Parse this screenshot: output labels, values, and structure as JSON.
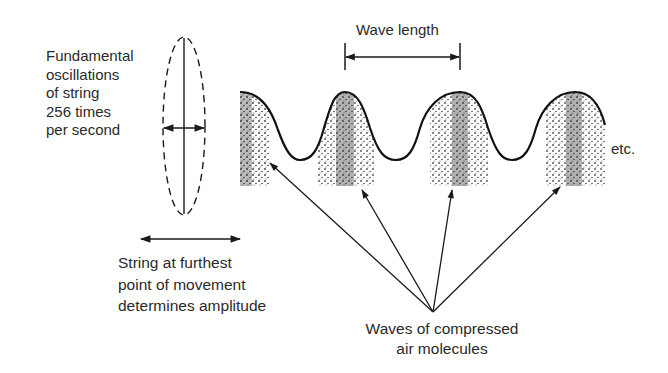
{
  "diagram": {
    "title": "",
    "labels": {
      "fundamental_line1": "Fundamental",
      "fundamental_line2": "oscillations",
      "fundamental_line3": "of string",
      "fundamental_line4": "256 times",
      "fundamental_line5": "per second",
      "amplitude_line1": "String at furthest",
      "amplitude_line2": "point of movement",
      "amplitude_line3": "determines amplitude",
      "wavelength": "Wave length",
      "etc": "etc.",
      "waves_line1": "Waves of compressed",
      "waves_line2": "air molecules"
    },
    "elements": {
      "string": "vertical vibrating string within dashed ellipse",
      "oscillation_arrow": "double-headed horizontal arrow",
      "amplitude_arrow": "double-headed horizontal arrow",
      "wave": "sinusoidal wave with stippled compression bands",
      "wavelength_marker": "double-headed arrow between crests",
      "pointer_arrows": 4
    },
    "colors": {
      "ink": "#1a1a1a",
      "background": "#ffffff"
    }
  }
}
